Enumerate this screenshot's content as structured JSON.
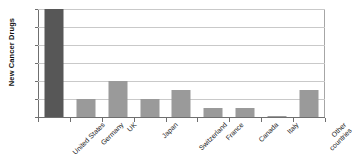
{
  "chart_data": {
    "type": "bar",
    "title": "",
    "xlabel": "",
    "ylabel": "New Cancer Drugs",
    "ylim": [
      0,
      12
    ],
    "ytick_step": 2,
    "yticks": [
      "12",
      "10",
      "8",
      "6",
      "4",
      "2",
      "0"
    ],
    "grid": true,
    "legend": "none",
    "categories": [
      "United States",
      "Germany",
      "UK",
      "Japan",
      "Switzerland",
      "France",
      "Canada",
      "Italy",
      "Other countries"
    ],
    "category_lines": [
      [
        "United States"
      ],
      [
        "Germany"
      ],
      [
        "UK"
      ],
      [
        "Japan"
      ],
      [
        "Switzerland"
      ],
      [
        "France"
      ],
      [
        "Canada"
      ],
      [
        "Italy"
      ],
      [
        "Other",
        "countries"
      ]
    ],
    "values": [
      12,
      2,
      4,
      2,
      3,
      1,
      1,
      0,
      3
    ],
    "bar_colors": [
      "#575757",
      "#9a9a9a",
      "#9a9a9a",
      "#9a9a9a",
      "#9a9a9a",
      "#9a9a9a",
      "#9a9a9a",
      "#9a9a9a",
      "#9a9a9a"
    ],
    "colors": {
      "highlight_bar": "#575757",
      "default_bar": "#9a9a9a",
      "gridline": "#c9c9c9",
      "axis": "#6f6f6f",
      "text": "#1a1a1a",
      "background": "#ffffff"
    }
  },
  "title_sliver": {
    "text": ""
  }
}
